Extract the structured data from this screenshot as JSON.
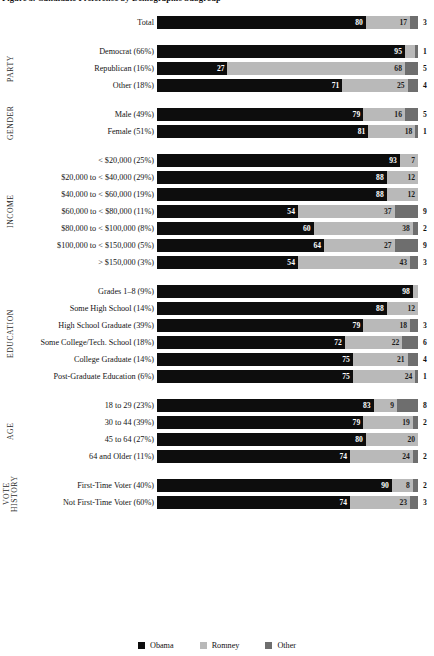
{
  "title": "Figure 3. Candidate Preference by Demographic Subgroup",
  "legend": {
    "position": "bottom-center",
    "items": [
      {
        "label": "Obama",
        "color": "#0d0d0d"
      },
      {
        "label": "Romney",
        "color": "#b9b9b9"
      },
      {
        "label": "Other",
        "color": "#6e6e6e"
      }
    ]
  },
  "groups": [
    {
      "name": ""
    },
    {
      "name": "PARTY"
    },
    {
      "name": "GENDER"
    },
    {
      "name": "INCOME"
    },
    {
      "name": "EDUCATION"
    },
    {
      "name": "AGE"
    },
    {
      "name": "VOTE\nHISTORY"
    }
  ],
  "chart_data": {
    "type": "bar",
    "orientation": "horizontal",
    "stacked": true,
    "normalized": true,
    "title": "Figure 3. Candidate Preference by Demographic Subgroup",
    "xlabel": "",
    "ylabel": "",
    "xlim": [
      0,
      100
    ],
    "grid": false,
    "legend_position": "bottom-center",
    "series": [
      {
        "name": "Obama",
        "color": "#0d0d0d"
      },
      {
        "name": "Romney",
        "color": "#b9b9b9"
      },
      {
        "name": "Other",
        "color": "#6e6e6e"
      }
    ],
    "groups": [
      {
        "group": "",
        "rows": [
          {
            "category": "Total",
            "share": "",
            "values": [
              80,
              17,
              3
            ]
          }
        ]
      },
      {
        "group": "PARTY",
        "rows": [
          {
            "category": "Democrat (66%)",
            "share": "66%",
            "values": [
              95,
              4,
              1
            ]
          },
          {
            "category": "Republican (16%)",
            "share": "16%",
            "values": [
              27,
              68,
              5
            ]
          },
          {
            "category": "Other (18%)",
            "share": "18%",
            "values": [
              71,
              25,
              4
            ]
          }
        ]
      },
      {
        "group": "GENDER",
        "rows": [
          {
            "category": "Male (49%)",
            "share": "49%",
            "values": [
              79,
              16,
              5
            ]
          },
          {
            "category": "Female (51%)",
            "share": "51%",
            "values": [
              81,
              18,
              1
            ]
          }
        ]
      },
      {
        "group": "INCOME",
        "rows": [
          {
            "category": "< $20,000 (25%)",
            "share": "25%",
            "values": [
              93,
              7,
              0
            ]
          },
          {
            "category": "$20,000 to < $40,000 (29%)",
            "share": "29%",
            "values": [
              88,
              12,
              0
            ]
          },
          {
            "category": "$40,000 to < $60,000 (19%)",
            "share": "19%",
            "values": [
              88,
              12,
              0
            ]
          },
          {
            "category": "$60,000 to < $80,000 (11%)",
            "share": "11%",
            "values": [
              54,
              37,
              9
            ]
          },
          {
            "category": "$80,000 to < $100,000 (8%)",
            "share": "8%",
            "values": [
              60,
              38,
              2
            ]
          },
          {
            "category": "$100,000 to < $150,000 (5%)",
            "share": "5%",
            "values": [
              64,
              27,
              9
            ]
          },
          {
            "category": "> $150,000 (3%)",
            "share": "3%",
            "values": [
              54,
              43,
              3
            ]
          }
        ]
      },
      {
        "group": "EDUCATION",
        "rows": [
          {
            "category": "Grades 1–8 (9%)",
            "share": "9%",
            "values": [
              98,
              2,
              0
            ]
          },
          {
            "category": "Some High School (14%)",
            "share": "14%",
            "values": [
              88,
              12,
              0
            ]
          },
          {
            "category": "High School Graduate (39%)",
            "share": "39%",
            "values": [
              79,
              18,
              3
            ]
          },
          {
            "category": "Some College/Tech. School (18%)",
            "share": "18%",
            "values": [
              72,
              22,
              6
            ]
          },
          {
            "category": "College Graduate (14%)",
            "share": "14%",
            "values": [
              75,
              21,
              4
            ]
          },
          {
            "category": "Post-Graduate Education (6%)",
            "share": "6%",
            "values": [
              75,
              24,
              1
            ]
          }
        ]
      },
      {
        "group": "AGE",
        "rows": [
          {
            "category": "18 to 29 (23%)",
            "share": "23%",
            "values": [
              83,
              9,
              8
            ]
          },
          {
            "category": "30 to 44 (39%)",
            "share": "39%",
            "values": [
              79,
              19,
              2
            ]
          },
          {
            "category": "45 to 64 (27%)",
            "share": "27%",
            "values": [
              80,
              20,
              0
            ]
          },
          {
            "category": "64 and Older (11%)",
            "share": "11%",
            "values": [
              74,
              24,
              2
            ]
          }
        ]
      },
      {
        "group": "VOTE HISTORY",
        "rows": [
          {
            "category": "First-Time Voter (40%)",
            "share": "40%",
            "values": [
              90,
              8,
              2
            ]
          },
          {
            "category": "Not First-Time Voter (60%)",
            "share": "60%",
            "values": [
              74,
              23,
              3
            ]
          }
        ]
      }
    ]
  }
}
